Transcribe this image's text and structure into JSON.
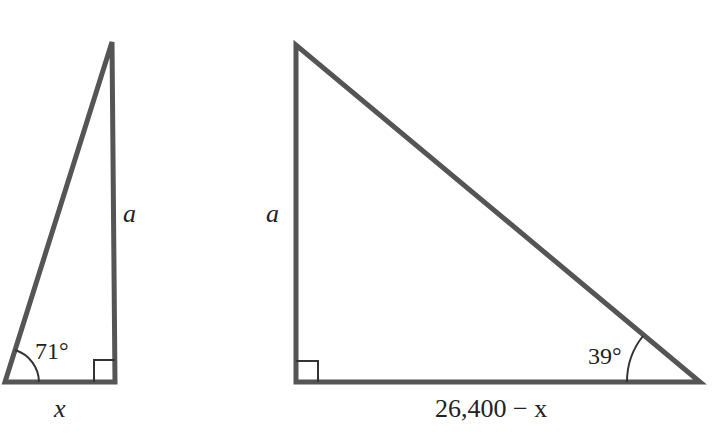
{
  "diagram": {
    "type": "two right triangles",
    "stroke_color": "#555555",
    "left_triangle": {
      "angle_label": "71°",
      "vertical_side_label": "a",
      "base_label": "x"
    },
    "right_triangle": {
      "angle_label": "39°",
      "vertical_side_label": "a",
      "base_label": "26,400 − x"
    }
  }
}
